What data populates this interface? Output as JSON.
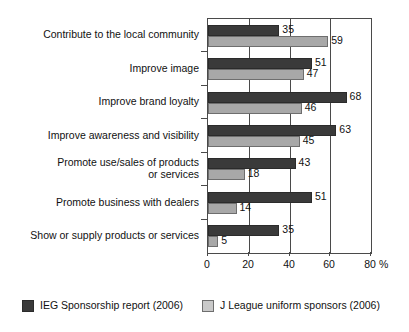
{
  "chart_data": {
    "type": "bar",
    "orientation": "horizontal",
    "title": "",
    "xlabel": "%",
    "ylabel": "",
    "xlim": [
      0,
      80
    ],
    "xticks": [
      0,
      20,
      40,
      60,
      80
    ],
    "xtick_labels": [
      "0",
      "20",
      "40",
      "60",
      "80"
    ],
    "grid": true,
    "grid_axis": "x",
    "legend_position": "bottom",
    "categories": [
      "Contribute to the local community",
      "Improve image",
      "Improve brand loyalty",
      "Improve awareness and visibility",
      "Promote use/sales of products\nor services",
      "Promote business with dealers",
      "Show or supply products or services"
    ],
    "series": [
      {
        "name": "IEG Sponsorship report (2006)",
        "color": "#3a3a3a",
        "values": [
          35,
          51,
          68,
          63,
          43,
          51,
          35
        ]
      },
      {
        "name": "J League uniform sponsors (2006)",
        "color": "#a8a8a8",
        "values": [
          59,
          47,
          46,
          45,
          18,
          14,
          5
        ]
      }
    ]
  },
  "axis": {
    "unit_label": "%"
  },
  "legend": {
    "items": [
      {
        "label": "IEG Sponsorship report (2006)",
        "swatch": "series-0"
      },
      {
        "label": "J League uniform sponsors (2006)",
        "swatch": "series-1"
      }
    ]
  }
}
